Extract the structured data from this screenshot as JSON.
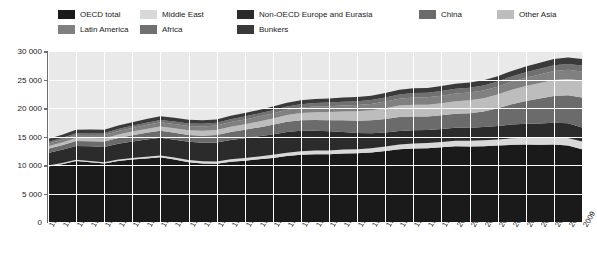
{
  "legend": {
    "items": [
      {
        "label": "OECD total",
        "color": "#1a1a1a",
        "row": 1,
        "x": 58
      },
      {
        "label": "Middle East",
        "color": "#d8d8d8",
        "row": 1,
        "x": 140
      },
      {
        "label": "Non-OECD Europe and Eurasia",
        "color": "#2b2b2b",
        "row": 1,
        "x": 237
      },
      {
        "label": "China",
        "color": "#6b6b6b",
        "row": 1,
        "x": 419
      },
      {
        "label": "Other Asia",
        "color": "#bdbdbd",
        "row": 1,
        "x": 497
      },
      {
        "label": "Latin America",
        "color": "#808080",
        "row": 2,
        "x": 58
      },
      {
        "label": "Africa",
        "color": "#707070",
        "row": 2,
        "x": 140
      },
      {
        "label": "Bunkers",
        "color": "#3a3a3a",
        "row": 2,
        "x": 237
      }
    ]
  },
  "axes": {
    "y_ticks": [
      "30 000",
      "25 000",
      "20 000",
      "15 000",
      "10 000",
      "5 000",
      "0"
    ],
    "y_min": 0,
    "y_max": 30000,
    "grid": true
  },
  "chart_data": {
    "type": "area",
    "title": "",
    "xlabel": "",
    "ylabel": "",
    "ylim": [
      0,
      30000
    ],
    "stacked": true,
    "legend_position": "top",
    "categories": [
      "1971",
      "1972",
      "1973",
      "1974",
      "1975",
      "1976",
      "1977",
      "1978",
      "1979",
      "1980",
      "1981",
      "1982",
      "1983",
      "1984",
      "1985",
      "1986",
      "1987",
      "1988",
      "1989",
      "1990",
      "1991",
      "1992",
      "1993",
      "1994",
      "1995",
      "1996",
      "1997",
      "1998",
      "1999",
      "2000",
      "2001",
      "2002",
      "2003",
      "2004",
      "2005",
      "2006",
      "2007",
      "2008",
      "2009"
    ],
    "series": [
      {
        "name": "OECD total",
        "color": "#1a1a1a",
        "values": [
          9750,
          10150,
          10700,
          10500,
          10250,
          10700,
          10950,
          11150,
          11350,
          10950,
          10500,
          10250,
          10200,
          10550,
          10750,
          11000,
          11250,
          11600,
          11800,
          11900,
          11900,
          12000,
          12050,
          12200,
          12450,
          12750,
          12900,
          12950,
          13100,
          13300,
          13250,
          13300,
          13400,
          13550,
          13600,
          13550,
          13600,
          13400,
          12750
        ]
      },
      {
        "name": "Middle East",
        "color": "#d8d8d8",
        "values": [
          170,
          185,
          200,
          215,
          235,
          255,
          280,
          305,
          330,
          350,
          375,
          400,
          425,
          455,
          480,
          510,
          540,
          570,
          600,
          630,
          665,
          700,
          730,
          760,
          790,
          825,
          860,
          895,
          930,
          965,
          1000,
          1040,
          1080,
          1130,
          1180,
          1230,
          1280,
          1340,
          1390
        ]
      },
      {
        "name": "Non-OECD Europe and Eurasia",
        "color": "#2b2b2b",
        "values": [
          2200,
          2320,
          2450,
          2560,
          2660,
          2780,
          2900,
          3010,
          3100,
          3150,
          3200,
          3260,
          3320,
          3390,
          3450,
          3520,
          3580,
          3620,
          3600,
          3500,
          3350,
          3100,
          2850,
          2600,
          2450,
          2400,
          2330,
          2280,
          2280,
          2280,
          2300,
          2320,
          2380,
          2430,
          2460,
          2520,
          2540,
          2580,
          2420
        ]
      },
      {
        "name": "China",
        "color": "#6b6b6b",
        "values": [
          720,
          800,
          860,
          900,
          960,
          1000,
          1090,
          1180,
          1230,
          1220,
          1200,
          1240,
          1300,
          1400,
          1500,
          1570,
          1680,
          1790,
          1850,
          1880,
          1950,
          2040,
          2150,
          2270,
          2400,
          2450,
          2420,
          2400,
          2420,
          2450,
          2550,
          2730,
          3080,
          3550,
          3980,
          4380,
          4700,
          4900,
          5300
        ]
      },
      {
        "name": "Other Asia",
        "color": "#bdbdbd",
        "values": [
          440,
          480,
          520,
          540,
          560,
          600,
          640,
          690,
          740,
          770,
          800,
          840,
          890,
          930,
          980,
          1030,
          1100,
          1180,
          1270,
          1360,
          1450,
          1550,
          1650,
          1760,
          1880,
          2000,
          2080,
          2050,
          2120,
          2200,
          2260,
          2330,
          2420,
          2540,
          2620,
          2700,
          2800,
          2880,
          2960
        ]
      },
      {
        "name": "Latin America",
        "color": "#808080",
        "values": [
          470,
          500,
          540,
          570,
          590,
          620,
          650,
          690,
          730,
          750,
          770,
          780,
          790,
          810,
          830,
          860,
          890,
          920,
          950,
          980,
          1010,
          1050,
          1080,
          1120,
          1160,
          1210,
          1260,
          1300,
          1320,
          1360,
          1360,
          1370,
          1380,
          1420,
          1470,
          1510,
          1560,
          1600,
          1590
        ]
      },
      {
        "name": "Africa",
        "color": "#707070",
        "values": [
          280,
          300,
          320,
          335,
          350,
          365,
          385,
          405,
          425,
          440,
          455,
          470,
          485,
          500,
          520,
          540,
          560,
          580,
          600,
          620,
          640,
          655,
          670,
          690,
          710,
          740,
          760,
          780,
          800,
          820,
          840,
          860,
          890,
          920,
          950,
          980,
          1010,
          1040,
          1060
        ]
      },
      {
        "name": "Bunkers",
        "color": "#3a3a3a",
        "values": [
          540,
          570,
          600,
          590,
          580,
          600,
          620,
          640,
          660,
          640,
          620,
          600,
          590,
          600,
          610,
          630,
          650,
          670,
          690,
          710,
          720,
          730,
          740,
          760,
          790,
          810,
          840,
          860,
          880,
          900,
          900,
          910,
          930,
          970,
          1010,
          1050,
          1100,
          1140,
          1120
        ]
      }
    ]
  }
}
